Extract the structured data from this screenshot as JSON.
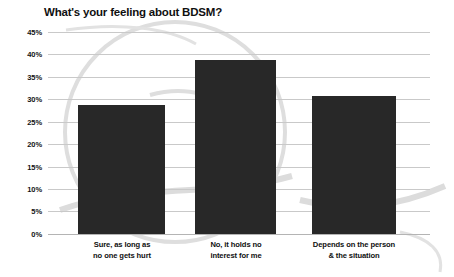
{
  "chart_data": {
    "type": "bar",
    "title": "What's your feeling about BDSM?",
    "xlabel": "",
    "ylabel": "",
    "categories": [
      "Sure, as long as\nno one gets hurt",
      "No, it holds no\ninterest for me",
      "Depends on the person\n& the situation"
    ],
    "category_lines": [
      [
        "Sure, as long as",
        "no one gets hurt"
      ],
      [
        "No, it holds no",
        "interest for me"
      ],
      [
        "Depends on the person",
        "& the situation"
      ]
    ],
    "values": [
      28.7,
      38.8,
      30.8
    ],
    "ylim": [
      0,
      45
    ],
    "ytick_values": [
      45,
      40,
      35,
      30,
      25,
      20,
      15,
      10,
      5,
      0
    ],
    "ytick_labels": [
      "45%",
      "40%",
      "35%",
      "30%",
      "25%",
      "20%",
      "15%",
      "10%",
      "5%",
      "0%"
    ],
    "grid": true,
    "legend": false,
    "colors": {
      "bar": "#282828",
      "gridline": "#c9c9c9",
      "baseline": "#b4b4b4",
      "text": "#101010",
      "background": "#ffffff",
      "watermark": "#dcdcdc"
    }
  }
}
